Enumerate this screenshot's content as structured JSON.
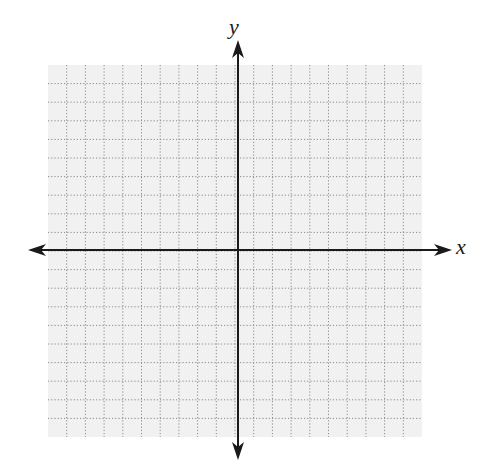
{
  "diagram": {
    "type": "cartesian-coordinate-plane",
    "x_axis_label": "x",
    "y_axis_label": "y",
    "grid": {
      "columns": 20,
      "rows": 20,
      "left": 48,
      "top": 65,
      "right": 422,
      "bottom": 437,
      "line_style": "dotted",
      "line_color": "#8a8a8a",
      "background_color": "#f1f1f1"
    },
    "origin": {
      "x": 238,
      "y": 250
    },
    "axes": {
      "color": "#1a1a1a",
      "x_axis": {
        "from": 28,
        "to": 452
      },
      "y_axis": {
        "from": 40,
        "to": 460
      },
      "arrows_both_ends": true
    }
  }
}
